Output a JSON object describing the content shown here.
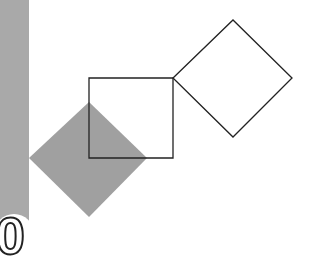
{
  "figure": {
    "background_color": "#ffffff",
    "side_bar": {
      "color": "#a9a9a9"
    },
    "shapes": [
      {
        "name": "filled-diamond",
        "type": "diamond",
        "fill": "#a0a0a0",
        "stroke": "none",
        "points": "29,158 89,102 147,158 89,217"
      },
      {
        "name": "outlined-square",
        "type": "square",
        "fill": "none",
        "stroke": "#222222",
        "points": "89,78 173,78 173,158 89,158"
      },
      {
        "name": "outlined-diamond",
        "type": "diamond",
        "fill": "none",
        "stroke": "#222222",
        "points": "173,78 233,20 292,78 233,137"
      }
    ],
    "corner_glyph": "0"
  }
}
